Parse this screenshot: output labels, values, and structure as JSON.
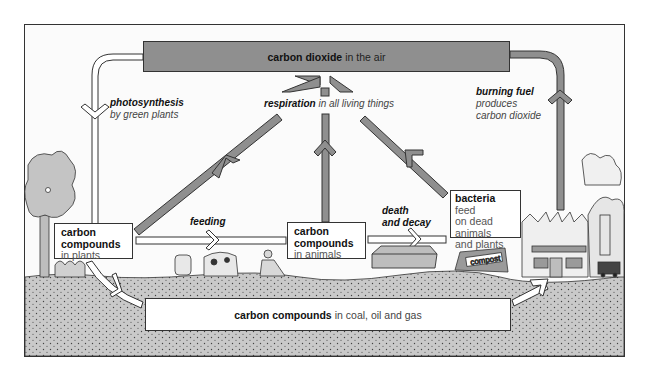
{
  "diagram": {
    "colors": {
      "frame_border": "#333333",
      "sky": "#fbfbfb",
      "co2_box": "#8f8f8f",
      "arrow_gray": "#8f8f8f",
      "arrow_white": "#ffffff",
      "soil": "#c9c9c9",
      "soil_dots": "#444444"
    },
    "co2_box": {
      "bold": "carbon dioxide",
      "rest": "in the air"
    },
    "photosynthesis": {
      "bold": "photosynthesis",
      "rest": "by green plants"
    },
    "respiration": {
      "bold": "respiration",
      "rest": "in all living things"
    },
    "burning": {
      "bold": "burning fuel",
      "line2": "produces",
      "line3": "carbon dioxide"
    },
    "feeding": {
      "label": "feeding"
    },
    "death": {
      "line1": "death",
      "line2": "and decay"
    },
    "plants_box": {
      "line1": "carbon",
      "line2": "compounds",
      "line3": "in plants"
    },
    "animals_box": {
      "line1": "carbon",
      "line2": "compounds",
      "line3": "in animals"
    },
    "bacteria_box": {
      "bold": "bacteria",
      "line1_rest": "feed",
      "line2": "on dead",
      "line3": "animals",
      "line4": "and plants"
    },
    "fossil_box": {
      "bold": "carbon compounds",
      "rest": "in coal, oil and gas"
    },
    "compost_sign": "compost",
    "icons": [
      "tree-icon",
      "cow-icon",
      "person-icon",
      "coffin-icon",
      "compost-heap-icon",
      "factory-icon",
      "power-station-icon",
      "truck-icon"
    ]
  }
}
